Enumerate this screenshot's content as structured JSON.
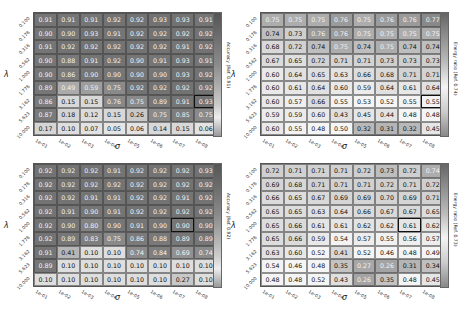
{
  "chart_data": [
    {
      "type": "heatmap",
      "panel": "top-left",
      "title": "",
      "xlabel": "σ",
      "ylabel": "λ",
      "x": [
        "1e-01",
        "1e-02",
        "1e-03",
        "1e-04",
        "1e-05",
        "1e-06",
        "1e-07",
        "1e-08"
      ],
      "y": [
        "0.100",
        "0.178",
        "0.316",
        "0.562",
        "1.000",
        "1.778",
        "3.162",
        "5.623",
        "10.000"
      ],
      "values": [
        [
          0.91,
          0.91,
          0.91,
          0.92,
          0.92,
          0.93,
          0.93,
          0.91
        ],
        [
          0.9,
          0.9,
          0.93,
          0.91,
          0.92,
          0.92,
          0.92,
          0.92
        ],
        [
          0.91,
          0.92,
          0.92,
          0.92,
          0.92,
          0.92,
          0.91,
          0.92
        ],
        [
          0.9,
          0.88,
          0.91,
          0.92,
          0.9,
          0.91,
          0.93,
          0.91
        ],
        [
          0.9,
          0.86,
          0.9,
          0.9,
          0.9,
          0.9,
          0.93,
          0.92
        ],
        [
          0.89,
          0.49,
          0.59,
          0.75,
          0.92,
          0.92,
          0.92,
          0.92
        ],
        [
          0.86,
          0.15,
          0.15,
          0.76,
          0.75,
          0.89,
          0.91,
          0.93
        ],
        [
          0.87,
          0.18,
          0.12,
          0.15,
          0.26,
          0.75,
          0.85,
          0.75
        ],
        [
          0.17,
          0.1,
          0.07,
          0.05,
          0.06,
          0.14,
          0.15,
          0.06
        ]
      ],
      "highlight": [
        6,
        7
      ],
      "colorbar_label": "Accuracy (Ref. 0.91)",
      "ref": 0.91,
      "cmap": "accuracy"
    },
    {
      "type": "heatmap",
      "panel": "top-right",
      "title": "",
      "xlabel": "σ",
      "ylabel": "λ",
      "x": [
        "1e-01",
        "1e-02",
        "1e-03",
        "1e-04",
        "1e-05",
        "1e-06",
        "1e-07",
        "1e-08"
      ],
      "y": [
        "0.100",
        "0.178",
        "0.316",
        "0.562",
        "1.000",
        "1.778",
        "3.162",
        "5.623",
        "10.000"
      ],
      "values": [
        [
          0.75,
          0.75,
          0.75,
          0.76,
          0.75,
          0.76,
          0.76,
          0.77
        ],
        [
          0.74,
          0.73,
          0.76,
          0.76,
          0.75,
          0.75,
          0.75,
          0.75
        ],
        [
          0.68,
          0.72,
          0.74,
          0.75,
          0.74,
          0.75,
          0.74,
          0.74
        ],
        [
          0.67,
          0.65,
          0.72,
          0.71,
          0.71,
          0.73,
          0.73,
          0.73
        ],
        [
          0.6,
          0.64,
          0.65,
          0.63,
          0.66,
          0.68,
          0.71,
          0.71
        ],
        [
          0.6,
          0.61,
          0.64,
          0.6,
          0.59,
          0.64,
          0.61,
          0.64
        ],
        [
          0.6,
          0.57,
          0.66,
          0.55,
          0.53,
          0.52,
          0.55,
          0.55
        ],
        [
          0.59,
          0.59,
          0.6,
          0.43,
          0.45,
          0.44,
          0.48,
          0.48
        ],
        [
          0.6,
          0.55,
          0.48,
          0.5,
          0.32,
          0.31,
          0.32,
          0.45
        ]
      ],
      "highlight": [
        6,
        7
      ],
      "colorbar_label": "Energy ratio (Ref. 0.74)",
      "ref": 0.74,
      "cmap": "energy"
    },
    {
      "type": "heatmap",
      "panel": "bottom-left",
      "title": "",
      "xlabel": "σ",
      "ylabel": "λ",
      "x": [
        "1e-01",
        "1e-02",
        "1e-03",
        "1e-04",
        "1e-05",
        "1e-06",
        "1e-07",
        "1e-08"
      ],
      "y": [
        "0.100",
        "0.178",
        "0.316",
        "0.562",
        "1.000",
        "1.778",
        "3.162",
        "5.623",
        "10.000"
      ],
      "values": [
        [
          0.92,
          0.92,
          0.92,
          0.91,
          0.92,
          0.92,
          0.92,
          0.93
        ],
        [
          0.92,
          0.92,
          0.92,
          0.92,
          0.92,
          0.92,
          0.92,
          0.92
        ],
        [
          0.92,
          0.92,
          0.91,
          0.91,
          0.92,
          0.92,
          0.91,
          0.92
        ],
        [
          0.92,
          0.91,
          0.9,
          0.91,
          0.92,
          0.92,
          0.92,
          0.92
        ],
        [
          0.92,
          0.9,
          0.8,
          0.9,
          0.91,
          0.9,
          0.9,
          0.9
        ],
        [
          0.92,
          0.89,
          0.83,
          0.75,
          0.86,
          0.88,
          0.89,
          0.89
        ],
        [
          0.91,
          0.41,
          0.1,
          0.1,
          0.74,
          0.84,
          0.69,
          0.74
        ],
        [
          0.89,
          0.1,
          0.1,
          0.1,
          0.1,
          0.1,
          0.1,
          0.1
        ],
        [
          0.1,
          0.1,
          0.1,
          0.1,
          0.1,
          0.1,
          0.27,
          0.1
        ]
      ],
      "highlight": [
        4,
        6
      ],
      "colorbar_label": "Accuracy (Ref. 0.92)",
      "ref": 0.92,
      "cmap": "accuracy"
    },
    {
      "type": "heatmap",
      "panel": "bottom-right",
      "title": "",
      "xlabel": "σ",
      "ylabel": "λ",
      "x": [
        "1e-01",
        "1e-02",
        "1e-03",
        "1e-04",
        "1e-05",
        "1e-06",
        "1e-07",
        "1e-08"
      ],
      "y": [
        "0.100",
        "0.178",
        "0.316",
        "0.562",
        "1.000",
        "1.778",
        "3.162",
        "5.623",
        "10.000"
      ],
      "values": [
        [
          0.72,
          0.71,
          0.71,
          0.71,
          0.72,
          0.73,
          0.72,
          0.74
        ],
        [
          0.69,
          0.68,
          0.71,
          0.71,
          0.71,
          0.72,
          0.71,
          0.72
        ],
        [
          0.66,
          0.65,
          0.67,
          0.69,
          0.69,
          0.7,
          0.69,
          0.71
        ],
        [
          0.65,
          0.65,
          0.63,
          0.64,
          0.66,
          0.67,
          0.67,
          0.65
        ],
        [
          0.65,
          0.66,
          0.61,
          0.61,
          0.62,
          0.62,
          0.61,
          0.62
        ],
        [
          0.65,
          0.66,
          0.59,
          0.54,
          0.57,
          0.55,
          0.56,
          0.57
        ],
        [
          0.63,
          0.6,
          0.52,
          0.41,
          0.52,
          0.46,
          0.48,
          0.49
        ],
        [
          0.54,
          0.46,
          0.48,
          0.35,
          0.27,
          0.26,
          0.31,
          0.34
        ],
        [
          0.48,
          0.48,
          0.52,
          0.43,
          0.26,
          0.35,
          0.48,
          0.45
        ]
      ],
      "highlight": [
        4,
        6
      ],
      "colorbar_label": "Energy ratio (Ref. 0.73)",
      "ref": 0.73,
      "cmap": "energy"
    }
  ]
}
